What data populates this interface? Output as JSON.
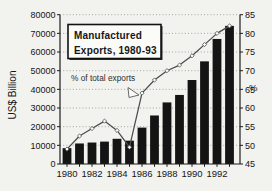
{
  "figure": {
    "title_line1": "Manufactured",
    "title_line2": "Exports, 1980-93",
    "annotation_label": "% of total exports",
    "left_axis_title": "US$ Billion",
    "right_axis_title": "%"
  },
  "chart_data": {
    "type": "bar",
    "title": "Manufactured Exports, 1980-93",
    "categories": [
      1980,
      1981,
      1982,
      1983,
      1984,
      1985,
      1986,
      1987,
      1988,
      1989,
      1990,
      1991,
      1992,
      1993
    ],
    "x_tick_labels": [
      "1980",
      "1982",
      "1984",
      "1986",
      "1988",
      "1990",
      "1992"
    ],
    "series": [
      {
        "name": "Manufactured exports",
        "type": "bar",
        "axis": "left",
        "values": [
          8500,
          11000,
          11500,
          12000,
          13500,
          12500,
          19500,
          26000,
          33000,
          37000,
          45000,
          55000,
          67000,
          74000
        ]
      },
      {
        "name": "% of total exports",
        "type": "line",
        "axis": "right",
        "values": [
          49,
          52.5,
          54.5,
          56.5,
          54,
          49.5,
          64,
          67.5,
          70,
          71.5,
          74,
          77,
          80,
          82
        ]
      }
    ],
    "left_axis": {
      "label": "US$ Billion",
      "min": 0,
      "max": 80000,
      "step": 10000
    },
    "right_axis": {
      "label": "%",
      "min": 45,
      "max": 85,
      "step": 5
    },
    "grid": "horizontal-dotted",
    "legend_position": "none",
    "colors": {
      "bar": "#141414",
      "line": "#4c4c4c",
      "marker_fill": "#fbfbf9",
      "grid": "#9d9d9a",
      "axis": "#1d1d1d",
      "background": "#f2f2ef",
      "box_fill": "#fbfbf8"
    }
  }
}
